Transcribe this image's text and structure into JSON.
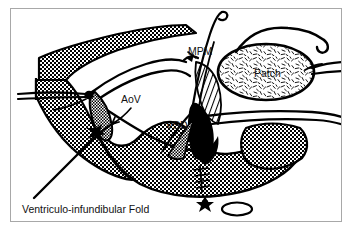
{
  "figure": {
    "kind": "medical-surgical-illustration",
    "background_color": "#ffffff",
    "ink_color": "#000000",
    "frame_color": "#a8a8a8"
  },
  "labels": {
    "mpm": "MPM",
    "patch": "Patch",
    "aov": "AoV",
    "vsd": "VSD",
    "ventriculo_infundibular_fold": "Ventriculo-infundibular Fold"
  },
  "label_positions": {
    "mpm": {
      "x": 188,
      "y": 55,
      "size": 10
    },
    "patch": {
      "x": 256,
      "y": 76,
      "size": 10
    },
    "aov": {
      "x": 121,
      "y": 102,
      "size": 10
    },
    "vsd": {
      "x": 167,
      "y": 128,
      "size": 10
    },
    "ventriculo_infundibular_fold": {
      "x": 22,
      "y": 212,
      "size": 10
    }
  },
  "anatomy": {
    "structures": [
      {
        "name": "myocardium-left",
        "texture": "stipple-dot",
        "region": "left"
      },
      {
        "name": "myocardium-right",
        "texture": "stipple-dot",
        "region": "right-lower"
      },
      {
        "name": "aortic-valve-leaflet",
        "texture": "stipple-dot",
        "abbr": "AoV"
      },
      {
        "name": "ventricular-septal-defect",
        "texture": "solid-black",
        "abbr": "VSD"
      },
      {
        "name": "medial-papillary-muscle",
        "abbr": "MPM"
      },
      {
        "name": "prosthetic-patch",
        "texture": "short-dash-fill",
        "abbr": "Patch"
      },
      {
        "name": "ventriculo-infundibular-fold",
        "texture": "line"
      }
    ],
    "markers": [
      {
        "name": "asterisk-marker",
        "shape": "star",
        "x": 205,
        "y": 202
      },
      {
        "name": "open-oval-marker",
        "shape": "ellipse",
        "x": 235,
        "y": 209
      }
    ],
    "sutures": {
      "count_visible": 6,
      "description": "interrupted pledgeted sutures passing from septum through patch"
    }
  }
}
